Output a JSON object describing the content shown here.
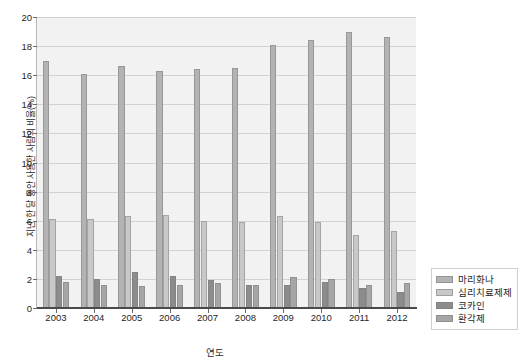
{
  "chart_data": {
    "type": "bar",
    "title": "",
    "xlabel": "연도",
    "ylabel": "지난 한 달 동안 사용한 사람의 비율(%)",
    "categories": [
      "2003",
      "2004",
      "2005",
      "2006",
      "2007",
      "2008",
      "2009",
      "2010",
      "2011",
      "2012"
    ],
    "ylim": [
      0,
      20
    ],
    "yticks": [
      "0",
      "2",
      "4",
      "6",
      "8",
      "10",
      "12",
      "14",
      "16",
      "18",
      "20"
    ],
    "ytick_values": [
      0,
      2,
      4,
      6,
      8,
      10,
      12,
      14,
      16,
      18,
      20
    ],
    "grid": true,
    "legend_position": "bottom-right",
    "series": [
      {
        "name": "마리화나",
        "color": "#b3b3b3",
        "values": [
          17.0,
          16.1,
          16.6,
          16.3,
          16.4,
          16.5,
          18.1,
          18.4,
          19.0,
          18.6
        ]
      },
      {
        "name": "심리치료제제",
        "color": "#c8c8c8",
        "values": [
          6.1,
          6.1,
          6.3,
          6.4,
          6.0,
          5.9,
          6.3,
          5.9,
          5.0,
          5.3
        ]
      },
      {
        "name": "코카인",
        "color": "#8c8c8c",
        "values": [
          2.2,
          2.0,
          2.5,
          2.2,
          1.9,
          1.6,
          1.6,
          1.8,
          1.4,
          1.1
        ]
      },
      {
        "name": "환각제",
        "color": "#a6a6a6",
        "values": [
          1.8,
          1.6,
          1.5,
          1.6,
          1.7,
          1.6,
          2.1,
          2.0,
          1.6,
          1.7
        ]
      }
    ]
  },
  "legend": {
    "items": [
      {
        "label": "마리화나"
      },
      {
        "label": "심리치료제제"
      },
      {
        "label": "코카인"
      },
      {
        "label": "환각제"
      }
    ]
  },
  "axes": {
    "x_title": "연도",
    "y_title": "지난 한 달 동안 사용한 사람의 비율(%)"
  }
}
